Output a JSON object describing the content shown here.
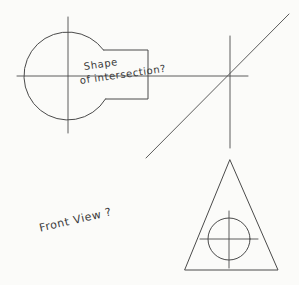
{
  "sheet": {
    "title": "Shape of intersection / Front View sketch",
    "background_color": "#fbfbf9",
    "ink_color": "#4a4a4a",
    "width": 299,
    "height": 285
  },
  "annotations": {
    "shape_line1": "Shape",
    "shape_line2": "of intersection?",
    "front_view": "Front View ?"
  },
  "geometry": {
    "top_view": {
      "label": "top-view-circle-with-tab",
      "circle": {
        "cx": 68,
        "cy": 76,
        "r": 44
      },
      "tab": {
        "left": 104,
        "top": 50,
        "right": 148,
        "bottom": 99
      },
      "center_line_horizontal": {
        "x1": 17,
        "y1": 76,
        "x2": 248,
        "y2": 76
      },
      "center_line_vertical": {
        "x1": 68,
        "y1": 17,
        "x2": 68,
        "y2": 133
      }
    },
    "diagonal": {
      "x1": 146,
      "y1": 158,
      "x2": 289,
      "y2": 14
    },
    "right_center_line_vertical": {
      "x1": 230,
      "y1": 36,
      "x2": 230,
      "y2": 148
    },
    "front_view": {
      "label": "front-view-triangle-with-circle",
      "triangle": {
        "apex_x": 230,
        "apex_y": 160,
        "left_x": 185,
        "right_x": 278,
        "base_y": 270
      },
      "circle": {
        "cx": 229,
        "cy": 239,
        "r": 21
      },
      "center_line_horizontal": {
        "x1": 200,
        "y1": 239,
        "x2": 258,
        "y2": 239
      },
      "center_line_vertical": {
        "x1": 229,
        "y1": 211,
        "x2": 229,
        "y2": 268
      }
    }
  }
}
